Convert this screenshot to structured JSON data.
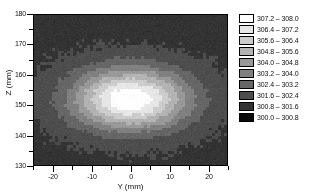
{
  "chart_data": {
    "type": "heatmap",
    "title": "",
    "xlabel": "Y (mm)",
    "ylabel": "Z (mm)",
    "xlim": [
      -25,
      25
    ],
    "ylim": [
      130,
      180
    ],
    "xticks": [
      -20,
      -10,
      0,
      10,
      20
    ],
    "xticklabels": [
      "-20",
      "-10",
      "0",
      "10",
      "20"
    ],
    "yticks": [
      130,
      140,
      150,
      160,
      170,
      180
    ],
    "yticklabels": [
      "130",
      "140",
      "150",
      "160",
      "170",
      "180"
    ],
    "x_minor_ticks": [
      -25,
      -15,
      -5,
      5,
      15,
      25
    ],
    "y_minor_ticks": [
      135,
      145,
      155,
      165,
      175
    ],
    "grid": false,
    "colormap": "grayscale",
    "legend_position": "right",
    "zmin": 300.0,
    "zmax": 308.0,
    "band_width": 0.8,
    "peak": {
      "y_mm": 0.0,
      "z_mm": 152.0,
      "value": 308.0
    },
    "background_value": 301.5,
    "blob": {
      "center_y_mm": 0.0,
      "center_z_mm": 152.0,
      "sigma_y_mm": 10.5,
      "sigma_z_mm": 7.0,
      "amplitude": 6.6,
      "base": 301.4
    },
    "legend_bands": [
      {
        "low": 307.2,
        "high": 308.0,
        "color": "#ffffff",
        "label": "307.2  –  308.0"
      },
      {
        "low": 306.4,
        "high": 307.2,
        "color": "#e6e6e6",
        "label": "306.4  –  307.2"
      },
      {
        "low": 305.6,
        "high": 306.4,
        "color": "#cccccc",
        "label": "305.6  –  306.4"
      },
      {
        "low": 304.8,
        "high": 305.6,
        "color": "#b3b3b3",
        "label": "304.8  –  305.6"
      },
      {
        "low": 304.0,
        "high": 304.8,
        "color": "#999999",
        "label": "304.0  –  304.8"
      },
      {
        "low": 303.2,
        "high": 304.0,
        "color": "#808080",
        "label": "303.2  –  304.0"
      },
      {
        "low": 302.4,
        "high": 303.2,
        "color": "#666666",
        "label": "302.4  –  303.2"
      },
      {
        "low": 301.6,
        "high": 302.4,
        "color": "#4d4d4d",
        "label": "301.6  –  302.4"
      },
      {
        "low": 300.8,
        "high": 301.6,
        "color": "#333333",
        "label": "300.8  –  301.6"
      },
      {
        "low": 300.0,
        "high": 300.8,
        "color": "#0a0a0a",
        "label": "300.0  –  300.8"
      }
    ]
  },
  "axes": {
    "x_title": "Y (mm)",
    "y_title": "Z (mm)"
  }
}
